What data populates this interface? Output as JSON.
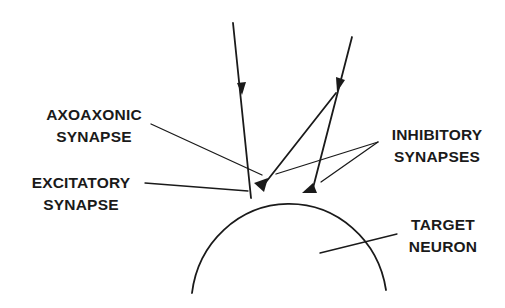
{
  "diagram": {
    "type": "neuron-synapse-schematic",
    "labels": {
      "axoaxonic": {
        "line1": "AXOAXONIC",
        "line2": "SYNAPSE"
      },
      "excitatory": {
        "line1": "EXCITATORY",
        "line2": "SYNAPSE"
      },
      "inhibitory": {
        "line1": "INHIBITORY",
        "line2": "SYNAPSES"
      },
      "target": {
        "line1": "TARGET",
        "line2": "NEURON"
      }
    },
    "colors": {
      "ink": "#1a1a1a",
      "background": "#ffffff"
    }
  }
}
